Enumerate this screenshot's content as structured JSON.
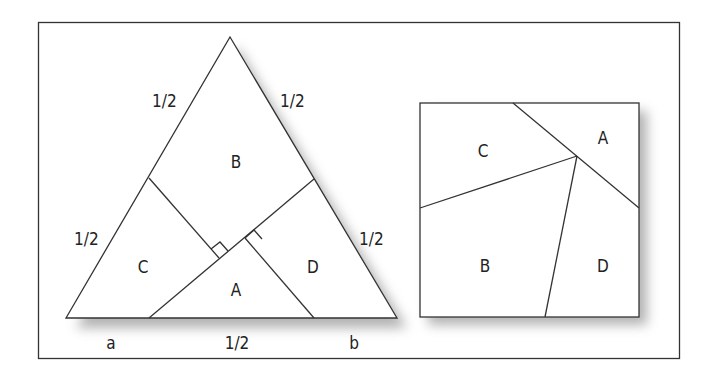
{
  "figure": {
    "triangle": {
      "side_labels": {
        "left_upper": "1/2",
        "right_upper": "1/2",
        "left_lower": "1/2",
        "right_lower": "1/2",
        "base_left": "a",
        "base_middle": "1/2",
        "base_right": "b"
      },
      "pieces": [
        "B",
        "C",
        "A",
        "D"
      ]
    },
    "square": {
      "pieces": [
        "C",
        "A",
        "B",
        "D"
      ]
    }
  },
  "colors": {
    "line": "#333333",
    "shadow": "#9a9a9a",
    "background": "#ffffff"
  }
}
